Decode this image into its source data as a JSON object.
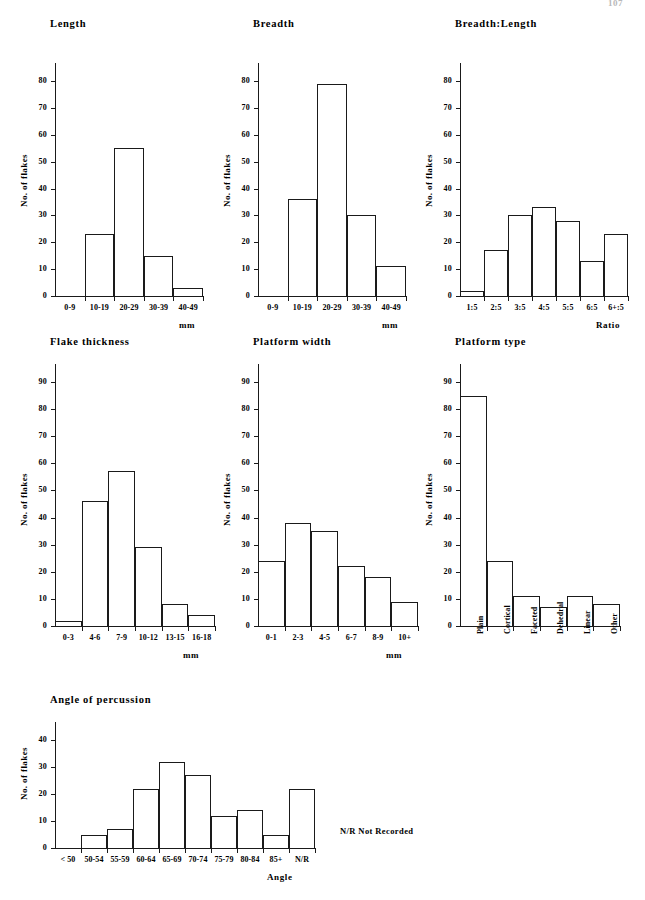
{
  "page": {
    "number": "107"
  },
  "notes": {
    "nr_legend": "N/R  Not Recorded"
  },
  "axis_labels": {
    "y_flakes": "No. of flakes",
    "x_mm": "mm",
    "x_ratio": "Ratio",
    "x_angle": "Angle"
  },
  "chart_data": [
    {
      "id": "length",
      "type": "bar",
      "title": "Length",
      "xlabel": "mm",
      "ylabel": "No. of flakes",
      "categories": [
        "0-9",
        "10-19",
        "20-29",
        "30-39",
        "40-49"
      ],
      "values": [
        0,
        23,
        55,
        15,
        3
      ],
      "ylim": [
        0,
        80
      ],
      "yticks": [
        0,
        10,
        20,
        30,
        40,
        50,
        60,
        70,
        80
      ],
      "grid": false,
      "legend": "none"
    },
    {
      "id": "breadth",
      "type": "bar",
      "title": "Breadth",
      "xlabel": "mm",
      "ylabel": "No. of flakes",
      "categories": [
        "0-9",
        "10-19",
        "20-29",
        "30-39",
        "40-49"
      ],
      "values": [
        0,
        36,
        79,
        30,
        11
      ],
      "ylim": [
        0,
        80
      ],
      "yticks": [
        0,
        10,
        20,
        30,
        40,
        50,
        60,
        70,
        80
      ],
      "grid": false,
      "legend": "none"
    },
    {
      "id": "breadth-length",
      "type": "bar",
      "title": "Breadth:Length",
      "xlabel": "Ratio",
      "ylabel": "No. of flakes",
      "categories": [
        "1:5",
        "2:5",
        "3:5",
        "4:5",
        "5:5",
        "6:5",
        "6+:5"
      ],
      "values": [
        2,
        17,
        30,
        33,
        28,
        13,
        23
      ],
      "ylim": [
        0,
        80
      ],
      "yticks": [
        0,
        10,
        20,
        30,
        40,
        50,
        60,
        70,
        80
      ],
      "grid": false,
      "legend": "none"
    },
    {
      "id": "flake-thickness",
      "type": "bar",
      "title": "Flake thickness",
      "xlabel": "mm",
      "ylabel": "No. of flakes",
      "categories": [
        "0-3",
        "4-6",
        "7-9",
        "10-12",
        "13-15",
        "16-18"
      ],
      "values": [
        2,
        46,
        57,
        29,
        8,
        4
      ],
      "ylim": [
        0,
        90
      ],
      "yticks": [
        0,
        10,
        20,
        30,
        40,
        50,
        60,
        70,
        80,
        90
      ],
      "grid": false,
      "legend": "none"
    },
    {
      "id": "platform-width",
      "type": "bar",
      "title": "Platform width",
      "xlabel": "mm",
      "ylabel": "No. of flakes",
      "categories": [
        "0-1",
        "2-3",
        "4-5",
        "6-7",
        "8-9",
        "10+"
      ],
      "values": [
        24,
        38,
        35,
        22,
        18,
        9
      ],
      "ylim": [
        0,
        90
      ],
      "yticks": [
        0,
        10,
        20,
        30,
        40,
        50,
        60,
        70,
        80,
        90
      ],
      "grid": false,
      "legend": "none"
    },
    {
      "id": "platform-type",
      "type": "bar",
      "title": "Platform type",
      "xlabel": "",
      "ylabel": "No. of flakes",
      "categories": [
        "Plain",
        "Cortical",
        "Faceted",
        "Dehedral",
        "Linear",
        "Other"
      ],
      "values": [
        85,
        24,
        11,
        7,
        11,
        8
      ],
      "ylim": [
        0,
        90
      ],
      "yticks": [
        0,
        10,
        20,
        30,
        40,
        50,
        60,
        70,
        80,
        90
      ],
      "rotated_xticks": true,
      "grid": false,
      "legend": "none"
    },
    {
      "id": "angle-of-percussion",
      "type": "bar",
      "title": "Angle of percussion",
      "xlabel": "Angle",
      "ylabel": "No. of flakes",
      "categories": [
        "< 50",
        "50-54",
        "55-59",
        "60-64",
        "65-69",
        "70-74",
        "75-79",
        "80-84",
        "85+",
        "N/R"
      ],
      "values": [
        0,
        5,
        7,
        22,
        32,
        27,
        12,
        14,
        5,
        22
      ],
      "ylim": [
        0,
        40
      ],
      "yticks": [
        0,
        10,
        20,
        30,
        40
      ],
      "grid": false,
      "legend": "none"
    }
  ]
}
